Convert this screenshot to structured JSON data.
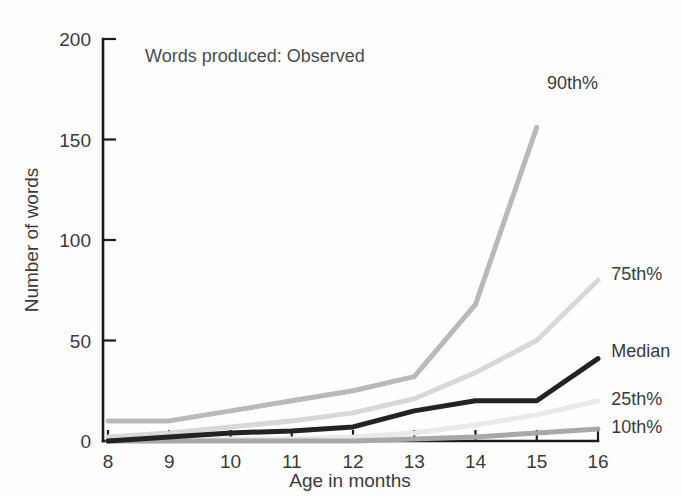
{
  "chart_data": {
    "type": "line",
    "title": "Words produced: Observed",
    "xlabel": "Age in months",
    "ylabel": "Number of words",
    "x": [
      8,
      9,
      10,
      11,
      12,
      13,
      14,
      15,
      16
    ],
    "xtick_labels": [
      "8",
      "9",
      "10",
      "11",
      "12",
      "13",
      "14",
      "15",
      "16"
    ],
    "ytick_labels": [
      "0",
      "50",
      "100",
      "150",
      "200"
    ],
    "yticks": [
      0,
      50,
      100,
      150,
      200
    ],
    "xlim": [
      8,
      16
    ],
    "ylim": [
      0,
      200
    ],
    "grid": false,
    "legend_position": "right-inline-end-of-line",
    "series": [
      {
        "name": "90th%",
        "label": "90th%",
        "color": "#b9b9b9",
        "width": 5,
        "x": [
          8,
          9,
          10,
          11,
          12,
          13,
          14,
          15
        ],
        "values": [
          10,
          10,
          15,
          20,
          25,
          32,
          68,
          156
        ],
        "label_x": 15.1,
        "label_y": 178
      },
      {
        "name": "75th%",
        "label": "75th%",
        "color": "#d8d8d8",
        "width": 5,
        "x": [
          8,
          9,
          10,
          11,
          12,
          13,
          14,
          15,
          16
        ],
        "values": [
          2,
          4,
          7,
          10,
          14,
          21,
          34,
          50,
          80
        ],
        "label_x": 16.15,
        "label_y": 83
      },
      {
        "name": "Median",
        "label": "Median",
        "color": "#232323",
        "width": 5,
        "x": [
          8,
          9,
          10,
          11,
          12,
          13,
          14,
          15,
          16
        ],
        "values": [
          0,
          2,
          4,
          5,
          7,
          15,
          20,
          20,
          41
        ],
        "label_x": 16.15,
        "label_y": 45
      },
      {
        "name": "25th%",
        "label": "25th%",
        "color": "#e9e9e9",
        "width": 5,
        "x": [
          8,
          9,
          10,
          11,
          12,
          13,
          14,
          15,
          16
        ],
        "values": [
          0,
          0,
          1,
          1,
          2,
          4,
          8,
          13,
          20
        ],
        "label_x": 16.15,
        "label_y": 21
      },
      {
        "name": "10th%",
        "label": "10th%",
        "color": "#a8a8a8",
        "width": 5,
        "x": [
          8,
          9,
          10,
          11,
          12,
          13,
          14,
          15,
          16
        ],
        "values": [
          0,
          0,
          0,
          0,
          0,
          1,
          2,
          4,
          6
        ],
        "label_x": 16.15,
        "label_y": 7
      }
    ]
  },
  "figure": {
    "title": "Words produced: Observed",
    "x_axis_title": "Age in months",
    "y_axis_title": "Number of words",
    "background": "#fefefe",
    "axis_color": "#1c1c1c"
  },
  "axis": {
    "y_ticks": [
      "200",
      "150",
      "100",
      "50",
      "0"
    ],
    "x_ticks": [
      "8",
      "9",
      "10",
      "11",
      "12",
      "13",
      "14",
      "15",
      "16"
    ]
  },
  "legend": {
    "entries": [
      "90th%",
      "75th%",
      "Median",
      "25th%",
      "10th%"
    ]
  }
}
